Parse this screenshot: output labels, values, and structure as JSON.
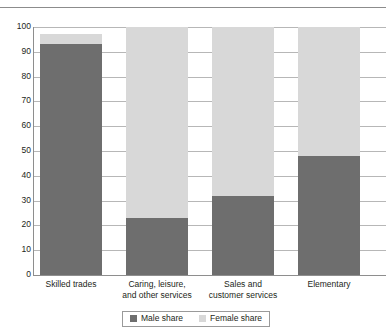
{
  "chart_data": {
    "type": "bar",
    "stacked": true,
    "stack_total": 100,
    "title": "",
    "xlabel": "",
    "ylabel": "",
    "ylim": [
      0,
      100
    ],
    "ytick_step": 10,
    "yticks": [
      "100",
      "90",
      "80",
      "70",
      "60",
      "50",
      "40",
      "30",
      "20",
      "10",
      "0"
    ],
    "grid": true,
    "legend_position": "bottom-center",
    "categories": [
      "Skilled trades",
      "Caring, leisure, and other services",
      "Sales and customer services",
      "Elementary"
    ],
    "category_lines": [
      [
        "Skilled trades"
      ],
      [
        "Caring, leisure,",
        "and other services"
      ],
      [
        "Sales and",
        "customer services"
      ],
      [
        "Elementary"
      ]
    ],
    "series": [
      {
        "name": "Male share",
        "color": "#6e6e6e",
        "values": [
          93,
          23,
          32,
          48
        ]
      },
      {
        "name": "Female share",
        "color": "#d8d8d8",
        "values": [
          4,
          77,
          68,
          52
        ]
      }
    ],
    "bar_tops": [
      97,
      100,
      100,
      100
    ],
    "annotations": []
  },
  "legend": {
    "items": [
      {
        "label": "Male share",
        "swatch": "male-swatch"
      },
      {
        "label": "Female share",
        "swatch": "female-swatch"
      }
    ]
  },
  "colors": {
    "male": "#6e6e6e",
    "female": "#d8d8d8",
    "gridline": "#b7b7b7",
    "axis": "#8e8e8e",
    "text": "#231f20"
  }
}
